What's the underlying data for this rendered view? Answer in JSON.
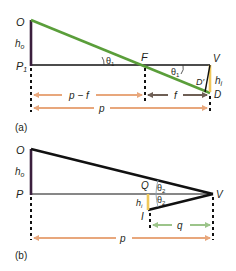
{
  "colors": {
    "ray_green": "#5a9e3a",
    "line_black": "#111111",
    "object_dark": "#3a1f3d",
    "image_yellow": "#f0c85a",
    "arrow_orange": "#e8a77c",
    "arrow_brown": "#6e5f55",
    "arrow_green": "#9cc48a"
  },
  "panel_a": {
    "caption": "(a)",
    "points": {
      "O": "O",
      "P1_base": "P",
      "P1_sub": "1",
      "F": "F",
      "V": "V",
      "D": "D",
      "D_prime": "D′"
    },
    "object_height": {
      "base": "h",
      "sub": "o"
    },
    "image_height": {
      "base": "h",
      "sub": "i"
    },
    "angles": [
      {
        "base": "θ",
        "sub": "1"
      },
      {
        "base": "θ",
        "sub": "1"
      }
    ],
    "dimensions": {
      "p_minus_f": "p − f",
      "f": "f",
      "p": "p"
    }
  },
  "panel_b": {
    "caption": "(b)",
    "points": {
      "O": "O",
      "P": "P",
      "Q": "Q",
      "V": "V",
      "I": "I"
    },
    "object_height": {
      "base": "h",
      "sub": "o"
    },
    "image_height": {
      "base": "h",
      "sub": "i"
    },
    "angles": [
      {
        "base": "θ",
        "sub": "2"
      },
      {
        "base": "θ",
        "sub": "2"
      }
    ],
    "dimensions": {
      "q": "q",
      "p": "p"
    }
  }
}
